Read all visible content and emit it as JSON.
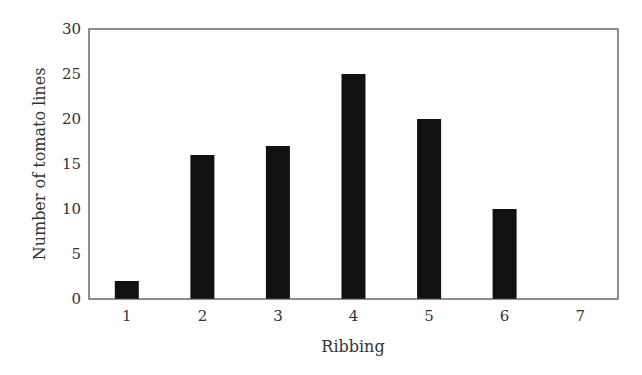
{
  "chart_data": {
    "type": "bar",
    "title": "",
    "xlabel": "Ribbing",
    "ylabel": "Number of tomato lines",
    "categories": [
      "1",
      "2",
      "3",
      "4",
      "5",
      "6",
      "7"
    ],
    "values": [
      2,
      16,
      17,
      25,
      20,
      10,
      0
    ],
    "ylim": [
      0,
      30
    ],
    "yticks": [
      0,
      5,
      10,
      15,
      20,
      25,
      30
    ],
    "grid": false,
    "legend": null,
    "bar_color": "#111111"
  }
}
